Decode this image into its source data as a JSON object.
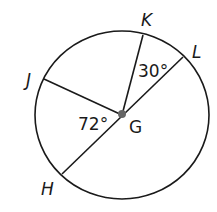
{
  "diagram": {
    "center": {
      "label": "G"
    },
    "points": [
      {
        "label": "K"
      },
      {
        "label": "L"
      },
      {
        "label": "J"
      },
      {
        "label": "H"
      }
    ],
    "angles": [
      {
        "between": "KGL",
        "label": "30°"
      },
      {
        "between": "JGH",
        "label": "72°"
      }
    ],
    "colors": {
      "stroke": "#1a1a1a",
      "center_dot": "#666666",
      "background": "#ffffff"
    }
  }
}
